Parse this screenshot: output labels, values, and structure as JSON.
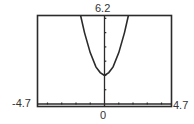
{
  "chart_data": {
    "type": "line",
    "title": "",
    "xlabel": "",
    "ylabel": "",
    "xlim": [
      -4.7,
      4.7
    ],
    "ylim": [
      0,
      6.2
    ],
    "x_tick_step": 1,
    "y_tick_step": 1,
    "grid": false,
    "legend": null,
    "labels": {
      "ymax": "6.2",
      "xmin": "-4.7",
      "xmax": "4.7",
      "origin": "0"
    },
    "series": [
      {
        "name": "curve",
        "description": "upward-opening parabola, vertex at (0, 2)",
        "x": [
          -1.68,
          -1.4,
          -1.0,
          -0.6,
          -0.3,
          0,
          0.3,
          0.6,
          1.0,
          1.4,
          1.68
        ],
        "y": [
          6.2,
          5.0,
          3.6,
          2.6,
          2.2,
          2.0,
          2.2,
          2.6,
          3.6,
          5.0,
          6.2
        ]
      }
    ]
  },
  "colors": {
    "frame": "#2b2b2b",
    "curve": "#2b2b2b",
    "axes": "#2b2b2b",
    "background": "#ffffff"
  }
}
